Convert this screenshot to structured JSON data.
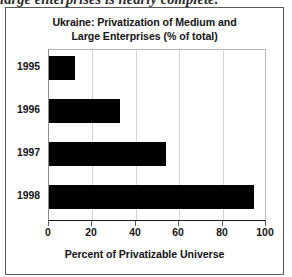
{
  "page": {
    "running_text_clipped": "large enterprises is nearly complete."
  },
  "figure": {
    "title_line_1": "Ukraine: Privatization of Medium and",
    "title_line_2": "Large Enterprises (% of total)",
    "x_axis_title": "Percent of Privatizable Universe"
  },
  "chart_data": {
    "type": "bar",
    "orientation": "horizontal",
    "title": "Ukraine: Privatization of Medium and Large Enterprises (% of total)",
    "xlabel": "Percent of Privatizable Universe",
    "ylabel": "",
    "categories": [
      "1995",
      "1996",
      "1997",
      "1998"
    ],
    "values": [
      12,
      33,
      54,
      95
    ],
    "xlim": [
      0,
      100
    ],
    "xticks": [
      0,
      20,
      40,
      60,
      80,
      100
    ],
    "xtick_labels": [
      "0",
      "20",
      "40",
      "60",
      "80",
      "100"
    ],
    "grid": true,
    "grid_axis": "x",
    "legend": false,
    "bar_color": "#000000",
    "series": [
      {
        "name": "Privatized share of privatizable universe",
        "values": [
          12,
          33,
          54,
          95
        ]
      }
    ]
  }
}
